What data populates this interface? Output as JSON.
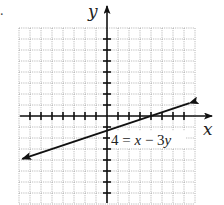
{
  "chart_data": {
    "type": "line",
    "title": "",
    "xlabel": "x",
    "ylabel": "y",
    "xlim": [
      -8,
      8
    ],
    "ylim": [
      -8,
      8
    ],
    "grid": true,
    "tick_spacing": 1,
    "tick_labels": false,
    "series": [
      {
        "name": "4 = x − 3y",
        "equation": "4 = x - 3y",
        "slope": 0.3333,
        "y_intercept": -1.3333,
        "x_intercept": 4,
        "x": [
          -7.7,
          -4,
          -1,
          4,
          7.5
        ],
        "y": [
          -3.9,
          -2.67,
          -1.67,
          0,
          1.17
        ],
        "arrows": "both"
      }
    ],
    "annotations": [
      {
        "text": "4 = x − 3y",
        "x": 2.2,
        "y": -2.5
      }
    ]
  },
  "labels": {
    "x_axis": "x",
    "y_axis": "y",
    "equation_lhs": "4 = ",
    "equation_x": "x",
    "equation_mid": " − 3",
    "equation_y": "y",
    "marker": "."
  },
  "colors": {
    "grid": "#9a9a9a",
    "axis": "#111111",
    "line": "#111111",
    "background": "#ffffff"
  }
}
